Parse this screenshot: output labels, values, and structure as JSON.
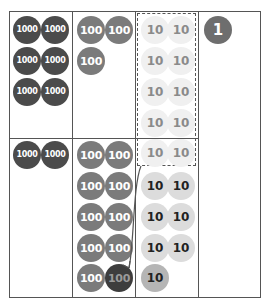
{
  "diagram": {
    "type": "place-value chart",
    "columns": [
      "thousands",
      "hundreds",
      "tens",
      "ones"
    ],
    "top_row": {
      "thousands": {
        "chip_label": "1000",
        "count": 6
      },
      "hundreds": {
        "chip_label": "100",
        "count": 3
      },
      "tens": {
        "chip_label": "10",
        "count": 10,
        "style": "faded, grouped in dashed box"
      },
      "ones": {
        "chip_label": "1",
        "count": 1
      }
    },
    "bottom_row": {
      "thousands": {
        "chip_label": "1000",
        "count": 2
      },
      "hundreds": {
        "chip_label": "100",
        "count": 10,
        "note": "last chip darker (regrouped)"
      },
      "tens": {
        "chip_label": "10",
        "count": 7,
        "note": "last chip darker"
      }
    },
    "annotation": "arrow from dashed group of ten 10s to the darker 100 chip",
    "colors": {
      "thousand_chip": "#4b4b4b",
      "hundred_chip": "#7b7b7b",
      "hundred_chip_regrouped": "#3d3d3d",
      "ten_chip": "#dcdcdc",
      "ten_chip_faded": "#f0f0f0",
      "one_chip": "#6e6e6e",
      "lines": "#555555"
    }
  },
  "labels": {
    "thousand": "1000",
    "hundred": "100",
    "ten": "10",
    "one": "1"
  }
}
